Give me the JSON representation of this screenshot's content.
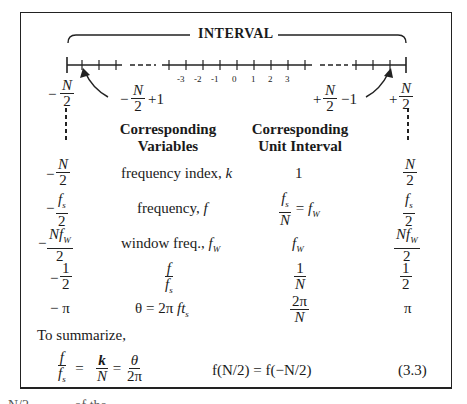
{
  "figure": {
    "interval_label": "INTERVAL",
    "tick_labels": [
      "-3",
      "-2",
      "-1",
      "0",
      "1",
      "2",
      "3"
    ],
    "endpoints": {
      "left": {
        "sign": "−",
        "num": "N",
        "den": "2"
      },
      "left_plus_one": {
        "sign": "−",
        "num": "N",
        "den": "2",
        "suffix": "+1"
      },
      "right_minus_one": {
        "sign": "+",
        "num": "N",
        "den": "2",
        "suffix": "−1"
      },
      "right": {
        "sign": "+",
        "num": "N",
        "den": "2"
      }
    }
  },
  "table": {
    "headers": {
      "variables": [
        "Corresponding",
        "Variables"
      ],
      "unit_interval": [
        "Corresponding",
        "Unit Interval"
      ]
    },
    "rows": [
      {
        "left": {
          "sign": "−",
          "num": "N",
          "den": "2"
        },
        "variable": "frequency index, k",
        "unit": "1",
        "right": {
          "num": "N",
          "den": "2"
        }
      },
      {
        "left": {
          "sign": "−",
          "num": "fₛ",
          "den": "2"
        },
        "variable": "frequency, f",
        "unit": "fₛ / N = f_W",
        "right": {
          "num": "fₛ",
          "den": "2"
        }
      },
      {
        "left": {
          "sign": "−",
          "num": "Nf_W",
          "den": "2"
        },
        "variable": "window freq., f_W",
        "unit": "f_W",
        "right": {
          "num": "Nf_W",
          "den": "2"
        }
      },
      {
        "left": {
          "sign": "−",
          "num": "1",
          "den": "2"
        },
        "variable": "f / fₛ",
        "unit": "1 / N",
        "right": {
          "num": "1",
          "den": "2"
        }
      },
      {
        "left": {
          "sign": "−",
          "num": "π",
          "den": ""
        },
        "variable": "θ = 2π f tₛ",
        "unit": "2π / N",
        "right": {
          "num": "π",
          "den": ""
        }
      }
    ]
  },
  "summary": {
    "intro": "To summarize,",
    "equation": "f / fₛ = k / N = θ / 2π",
    "symmetry": "f(N/2) = f(−N/2)",
    "equation_number": "(3.3)"
  },
  "cutoff_text": "N/2 ... (text cut off)"
}
